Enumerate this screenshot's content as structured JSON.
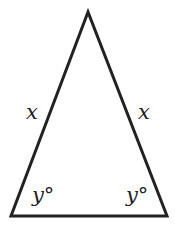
{
  "diagram": {
    "type": "isosceles-triangle",
    "stroke_color": "#222222",
    "vertices": {
      "apex": [
        88,
        12
      ],
      "bottom_left": [
        11,
        216
      ],
      "bottom_right": [
        167,
        216
      ]
    },
    "labels": {
      "left_side": "x",
      "right_side": "x",
      "left_angle": "y°",
      "right_angle": "y°"
    }
  }
}
